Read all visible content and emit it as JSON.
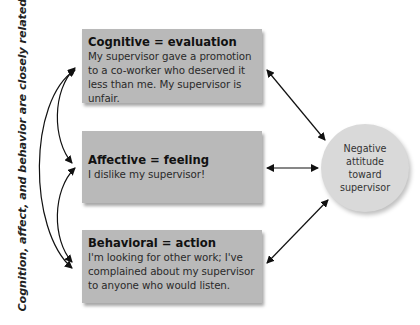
{
  "side_label": "Cognition, affect, and behavior are closely related.",
  "components": [
    {
      "title": "Cognitive = evaluation",
      "body": "My supervisor gave a promotion to a co-worker who deserved it less than me. My supervisor is unfair."
    },
    {
      "title": "Affective = feeling",
      "body": "I dislike my supervisor!"
    },
    {
      "title": "Behavioral = action",
      "body": "I'm looking for other work; I've complained about my supervisor to anyone who would listen."
    }
  ],
  "outcome": {
    "label": "Negative attitude toward supervisor"
  },
  "colors": {
    "box": "#b9b9b9",
    "circle": "#d9d9d9",
    "arrow": "#111111"
  }
}
